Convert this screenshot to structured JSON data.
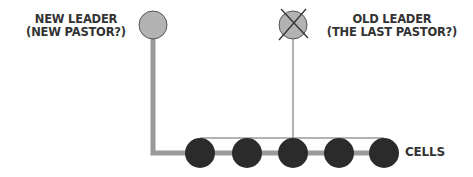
{
  "diagram": {
    "new_leader": {
      "line1": "NEW LEADER",
      "line2": "(NEW PASTOR?)",
      "fill": "#b3b3b3",
      "crossed_out": false
    },
    "old_leader": {
      "line1": "OLD LEADER",
      "line2": "(THE LAST PASTOR?)",
      "fill": "#b3b3b3",
      "crossed_out": true
    },
    "cells": {
      "label": "CELLS",
      "count": 5,
      "fill": "#2b2b2b"
    },
    "colors": {
      "thick_connector": "#9a9a9a",
      "thin_connector": "#555555",
      "text": "#333333",
      "outline": "#555555"
    }
  }
}
